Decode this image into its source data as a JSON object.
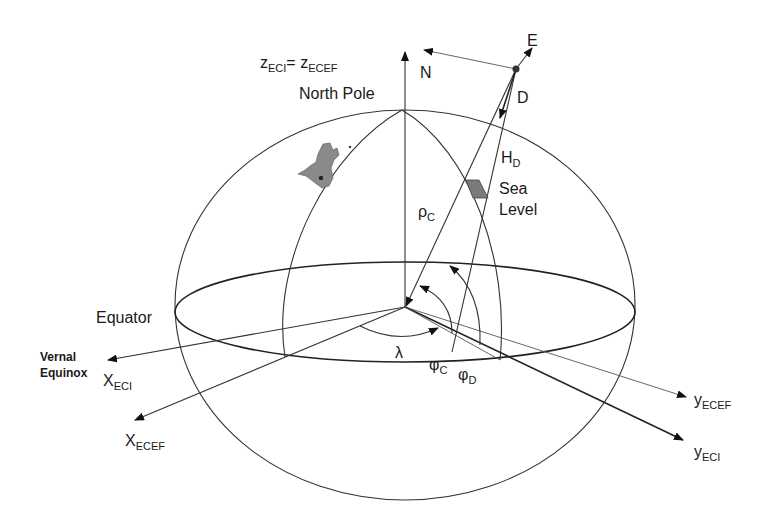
{
  "diagram": {
    "labels": {
      "z_axis": {
        "base": "z",
        "sub1": "ECI",
        "eq": "= ",
        "base2": "z",
        "sub2": "ECEF"
      },
      "north_pole": "North Pole",
      "north": "N",
      "east": "E",
      "down": "D",
      "height": {
        "base": "H",
        "sub": "D"
      },
      "sea_level_1": "Sea",
      "sea_level_2": "Level",
      "rho": {
        "base": "ρ",
        "sub": "C"
      },
      "equator": "Equator",
      "vernal_equinox_1": "Vernal",
      "vernal_equinox_2": "Equinox",
      "x_eci": {
        "base": "X",
        "sub": "ECI"
      },
      "x_ecef": {
        "base": "X",
        "sub": "ECEF"
      },
      "y_ecef": {
        "base": "y",
        "sub": "ECEF"
      },
      "y_eci": {
        "base": "y",
        "sub": "ECI"
      },
      "lambda": "λ",
      "phi_c": {
        "base": "φ",
        "sub": "C"
      },
      "phi_d": {
        "base": "φ",
        "sub": "D"
      }
    },
    "colors": {
      "line": "#333333",
      "land": "#8a8a8a",
      "sea_level_patch": "#7a7a7a"
    }
  }
}
